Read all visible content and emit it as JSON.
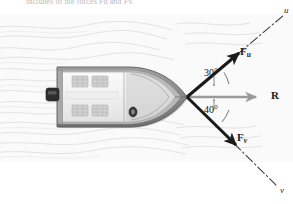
{
  "figure": {
    "caption_fragment": "includes of the forces Fu and Fv.",
    "background_color": "#ffffff",
    "water_color": "#f7f7f7"
  },
  "vectors": {
    "f_u": {
      "label": "F",
      "subscript": "u",
      "color": "#1b1b1b"
    },
    "f_v": {
      "label": "F",
      "subscript": "v",
      "color": "#1b1b1b"
    },
    "resultant": {
      "label": "R",
      "color": "#9a9a9a"
    }
  },
  "angles": {
    "upper": "30°",
    "lower": "40°"
  },
  "axes": {
    "u": "u",
    "v": "v"
  },
  "boat": {
    "hull_color": "#8c8c8c",
    "deck_color": "#f2f2f2",
    "seat_color": "#cfcfcf"
  }
}
